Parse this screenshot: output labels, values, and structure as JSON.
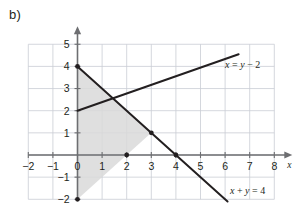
{
  "figure": {
    "part_label": "b)",
    "axis_x_name": "x",
    "axis_y_name": ""
  },
  "chart_data": {
    "type": "line",
    "title": "",
    "xlabel": "x",
    "ylabel": "",
    "xlim": [
      -2,
      8
    ],
    "ylim": [
      -2,
      5
    ],
    "grid": true,
    "legend": "none",
    "x_ticks": [
      "-2",
      "-1",
      "0",
      "1",
      "2",
      "3",
      "4",
      "5",
      "6",
      "7",
      "8"
    ],
    "x_tick_values": [
      -2,
      -1,
      0,
      1,
      2,
      3,
      4,
      5,
      6,
      7,
      8
    ],
    "y_ticks": [
      "-2",
      "-1",
      "0",
      "1",
      "2",
      "3",
      "4",
      "5"
    ],
    "y_tick_values": [
      -2,
      -1,
      0,
      1,
      2,
      3,
      4,
      5
    ],
    "series": [
      {
        "name": "x = y - 2",
        "label": "x = y − 2",
        "label_parts": {
          "lhs": "x",
          "mid": " = ",
          "rhs_var": "y",
          "rhs_rest": " − 2"
        },
        "label_x": 6.0,
        "label_y": 4.1,
        "equation_slope": 1,
        "equation_intercept": 2,
        "points": [
          [
            -2.0,
            0.0
          ],
          [
            6.5,
            8.5
          ]
        ],
        "draw_from": [
          0,
          2
        ],
        "draw_to": [
          6.55,
          4.55
        ],
        "color": "#231f20"
      },
      {
        "name": "x + y = 4",
        "label": "x + y = 4",
        "label_parts": {
          "lhs": "x",
          "mid": " + ",
          "rhs_var": "y",
          "rhs_rest": " = 4"
        },
        "label_x": 6.2,
        "label_y": -1.62,
        "equation_slope": -1,
        "equation_intercept": 4,
        "points": [
          [
            0.0,
            4.0
          ],
          [
            6.1,
            -2.1
          ]
        ],
        "draw_from": [
          0,
          4
        ],
        "draw_to": [
          6.1,
          -2.1
        ],
        "color": "#231f20"
      }
    ],
    "marked_points": [
      {
        "label": "(0, 4)",
        "x": 0,
        "y": 4
      },
      {
        "label": "(0, -2)",
        "x": 0,
        "y": -2
      },
      {
        "label": "(2, 0)",
        "x": 2,
        "y": 0
      },
      {
        "label": "(3, 1)",
        "x": 3,
        "y": 1
      },
      {
        "label": "(4, 0)",
        "x": 4,
        "y": 0
      }
    ],
    "shaded_region": {
      "name": "feasible-region",
      "vertices": [
        [
          0,
          4
        ],
        [
          3,
          1
        ],
        [
          0,
          -2
        ]
      ],
      "fill": "#d9d9d9",
      "opacity": 0.85
    },
    "colors": {
      "grid": "#c9cdd4",
      "axis": "#6d6e71",
      "line": "#231f20",
      "shade": "#d9d9d9",
      "text": "#231f20",
      "background": "#ffffff"
    }
  }
}
